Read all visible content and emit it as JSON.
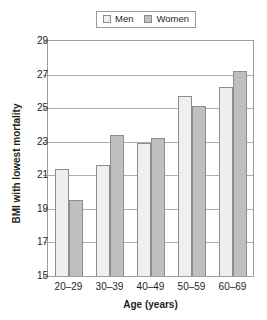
{
  "chart_data": {
    "type": "bar",
    "title": "",
    "xlabel": "Age (years)",
    "ylabel": "BMI with lowest mortality",
    "categories": [
      "20–29",
      "30–39",
      "40–49",
      "50–59",
      "60–69"
    ],
    "series": [
      {
        "name": "Men",
        "color": "#efefef",
        "values": [
          21.4,
          21.6,
          22.95,
          25.7,
          26.25
        ]
      },
      {
        "name": "Women",
        "color": "#bfbfbf",
        "values": [
          19.5,
          23.4,
          23.2,
          25.1,
          27.2
        ]
      }
    ],
    "ylim": [
      15,
      29
    ],
    "yticks": [
      15,
      17,
      19,
      21,
      23,
      25,
      27,
      29
    ],
    "ytick_labels": [
      "15",
      "17",
      "19",
      "21",
      "23",
      "25",
      "27",
      "29"
    ],
    "grid": true,
    "grid_axis": "y",
    "legend_position": "top-center",
    "legend": [
      "Men",
      "Women"
    ]
  },
  "legend": {
    "men_label": "Men",
    "women_label": "Women"
  },
  "axes": {
    "y_title": "BMI with lowest mortality",
    "x_title": "Age (years)"
  }
}
